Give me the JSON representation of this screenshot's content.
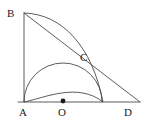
{
  "figure": {
    "background_color": "#ffffff",
    "stroke_color": "#4a4a4a",
    "label_color": "#1a1a1a",
    "points": [
      {
        "name": "A",
        "label": "A",
        "x": 24,
        "y": 102,
        "label_x": 19,
        "label_y": 107,
        "marked": false
      },
      {
        "name": "B",
        "label": "B",
        "x": 24,
        "y": 13,
        "label_x": 7,
        "label_y": 8,
        "marked": false
      },
      {
        "name": "C",
        "label": "C",
        "x": 80,
        "y": 66,
        "label_x": 80,
        "label_y": 52,
        "marked": false
      },
      {
        "name": "O",
        "label": "O",
        "x": 63,
        "y": 102,
        "label_x": 58,
        "label_y": 107,
        "marked": true
      },
      {
        "name": "D",
        "label": "D",
        "x": 132,
        "y": 102,
        "label_x": 124,
        "label_y": 107,
        "marked": false
      }
    ],
    "segments": [
      {
        "name": "segment-AB",
        "from": "A",
        "to": "B",
        "x1": 24,
        "y1": 102,
        "x2": 24,
        "y2": 13
      },
      {
        "name": "segment-AD",
        "from": "A",
        "to": "D",
        "x1": 18,
        "y1": 102,
        "x2": 140,
        "y2": 102
      },
      {
        "name": "segment-BD",
        "from": "B",
        "to": "D",
        "x1": 24,
        "y1": 13,
        "x2": 140,
        "y2": 102
      }
    ],
    "arcs": [
      {
        "name": "arc-semicircle-AO",
        "description": "Semicircle on diameter from A to the foot point, centered at O",
        "center_x": 63,
        "center_y": 102,
        "radius": 39,
        "path": "M 24 102 A 39 39 0 0 1 102 102"
      },
      {
        "name": "arc-B-to-base",
        "description": "Arc from B curving down to the base line",
        "path": "M 24 13 C 62 14 92 46 103 102"
      },
      {
        "name": "arc-A-through-C",
        "description": "Arc from A rising through C to the base foot point",
        "path": "M 24 102 C 44 98 78 82 103 102"
      }
    ],
    "point_marker_radius": 2.4,
    "line_width": 0.9
  }
}
